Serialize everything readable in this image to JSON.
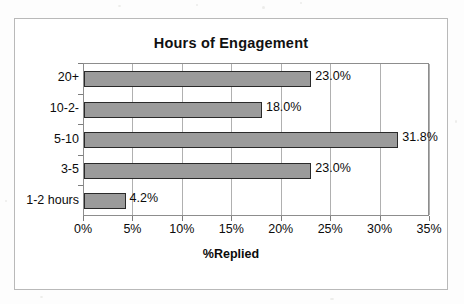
{
  "chart_data": {
    "type": "bar",
    "orientation": "horizontal",
    "title": "Hours of Engagement",
    "xlabel": "%Replied",
    "ylabel": "",
    "categories": [
      "1-2 hours",
      "3-5",
      "5-10",
      "10-2-",
      "20+"
    ],
    "values": [
      4.2,
      23.0,
      31.8,
      18.0,
      23.0
    ],
    "data_labels": [
      "4.2%",
      "23.0%",
      "31.8%",
      "18.0%",
      "23.0%"
    ],
    "xlim": [
      0,
      35
    ],
    "xticks": [
      0,
      5,
      10,
      15,
      20,
      25,
      30,
      35
    ],
    "xtick_labels": [
      "0%",
      "5%",
      "10%",
      "15%",
      "20%",
      "25%",
      "30%",
      "35%"
    ],
    "grid": "vertical",
    "legend": "none",
    "bar_color": "#9b9b9b",
    "bar_border_color": "#2a2a2a",
    "gridline_color": "#b0b0b0",
    "axis_color": "#8d8d8d",
    "frame_color": "#b9b9b9",
    "text_color": "#0b0b0b"
  }
}
